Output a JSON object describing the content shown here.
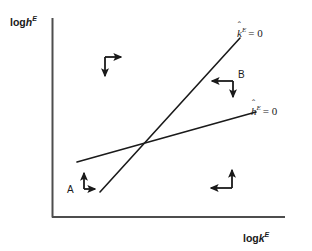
{
  "figure": {
    "type": "phase-diagram",
    "background": "#ffffff",
    "line_color": "#1a1a1a",
    "axes": {
      "y_label": {
        "prefix": "log",
        "variable": "h",
        "superscript": "E"
      },
      "x_label": {
        "prefix": "log",
        "variable": "k",
        "superscript": "E"
      },
      "origin": {
        "x": 52,
        "y": 217
      },
      "y_top": 18,
      "x_right": 285
    },
    "curves": [
      {
        "name": "k-nullcline",
        "label": {
          "variable": "k",
          "hat": "ˆ",
          "superscript": "E",
          "equals": "= 0"
        },
        "description": "steep upward sloping line",
        "from": {
          "x": 100,
          "y": 192
        },
        "to": {
          "x": 240,
          "y": 38
        }
      },
      {
        "name": "h-nullcline",
        "label": {
          "variable": "h",
          "hat": "ˆ",
          "superscript": "E",
          "equals": "= 0"
        },
        "description": "shallow upward sloping line",
        "from": {
          "x": 77,
          "y": 162
        },
        "to": {
          "x": 256,
          "y": 112
        }
      }
    ],
    "intersection": {
      "x": 145,
      "y": 143
    },
    "region_labels": [
      {
        "id": "A",
        "text": "A",
        "x": 67,
        "y": 185
      },
      {
        "id": "B",
        "text": "B",
        "x": 238,
        "y": 70
      }
    ],
    "direction_arrows": [
      {
        "id": "upper-left",
        "region": "north-west",
        "horizontal": "right",
        "vertical": "down",
        "corner": {
          "x": 105,
          "y": 57
        },
        "h_tip": {
          "x": 126,
          "y": 57
        },
        "v_tip": {
          "x": 105,
          "y": 81
        }
      },
      {
        "id": "upper-right-B",
        "region": "north-east",
        "horizontal": "left",
        "vertical": "down",
        "corner": {
          "x": 233,
          "y": 81
        },
        "h_tip": {
          "x": 207,
          "y": 81
        },
        "v_tip": {
          "x": 233,
          "y": 102
        }
      },
      {
        "id": "lower-left-A",
        "region": "south-west",
        "horizontal": "right",
        "vertical": "up",
        "corner": {
          "x": 84,
          "y": 189
        },
        "h_tip": {
          "x": 98,
          "y": 189
        },
        "v_tip": {
          "x": 84,
          "y": 169
        }
      },
      {
        "id": "lower-right",
        "region": "south-east",
        "horizontal": "left",
        "vertical": "up",
        "corner": {
          "x": 232,
          "y": 188
        },
        "h_tip": {
          "x": 206,
          "y": 188
        },
        "v_tip": {
          "x": 232,
          "y": 166
        }
      }
    ]
  }
}
